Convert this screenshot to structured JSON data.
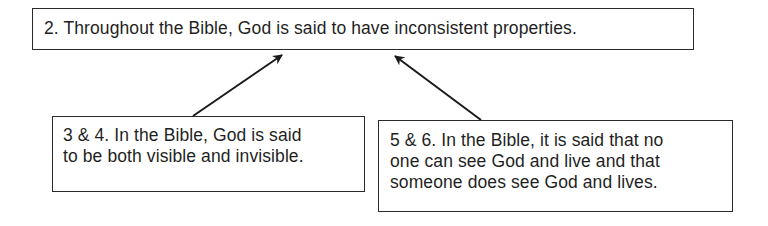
{
  "diagram": {
    "type": "argument-map",
    "nodes": [
      {
        "id": "claim-2",
        "label": "2. Throughout the Bible, God is said to have inconsistent properties.",
        "lines": [
          "2. Throughout the Bible, God is said to have inconsistent properties."
        ]
      },
      {
        "id": "premise-3-4",
        "label": "3 & 4. In the Bible, God is said to be both visible and invisible.",
        "lines": [
          "3 & 4. In the Bible, God is said",
          "to be both visible and invisible."
        ]
      },
      {
        "id": "premise-5-6",
        "label": "5 & 6. In the Bible, it is said that no one can see God and live and that someone does see God and lives.",
        "lines": [
          "5 & 6. In the Bible, it is said that no",
          "one can see God and live and that",
          "someone does see God and lives."
        ]
      }
    ],
    "edges": [
      {
        "from": "premise-3-4",
        "to": "claim-2"
      },
      {
        "from": "premise-5-6",
        "to": "claim-2"
      }
    ],
    "colors": {
      "stroke": "#2a2a2a",
      "text": "#1f1f1f",
      "background": "#ffffff"
    }
  }
}
